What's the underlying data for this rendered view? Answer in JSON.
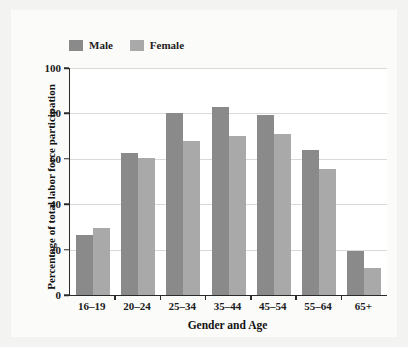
{
  "figure": {
    "background_color": "#f3f3f2",
    "card_color": "#fbfbfa",
    "plot_background_color": "#ffffff",
    "axis_color": "#2b2b2b",
    "grid_color": "#d9d9d9"
  },
  "legend": {
    "position": "top-left",
    "entries": [
      {
        "label": "Male",
        "color": "#8a8a8a"
      },
      {
        "label": "Female",
        "color": "#a9a9a9"
      }
    ]
  },
  "chart_data": {
    "type": "bar",
    "title": "",
    "subtitle": "",
    "xlabel": "Gender and Age",
    "ylabel": "Percentage of total labor force participation",
    "categories": [
      "16–19",
      "20–24",
      "25–34",
      "35–44",
      "45–54",
      "55–64",
      "65+"
    ],
    "series": [
      {
        "name": "Male",
        "color": "#8a8a8a",
        "values": [
          26.5,
          62.5,
          80,
          83,
          79.5,
          64,
          19.5
        ]
      },
      {
        "name": "Female",
        "color": "#a9a9a9",
        "values": [
          29.5,
          60.5,
          68,
          70,
          71,
          55.5,
          12
        ]
      }
    ],
    "ylim": [
      0,
      100
    ],
    "yticks": [
      0,
      20,
      40,
      60,
      80,
      100
    ],
    "ytick_labels": [
      "0",
      "20",
      "40",
      "60",
      "80",
      "100"
    ],
    "grid": "horizontal",
    "legend_position": "top-left"
  }
}
